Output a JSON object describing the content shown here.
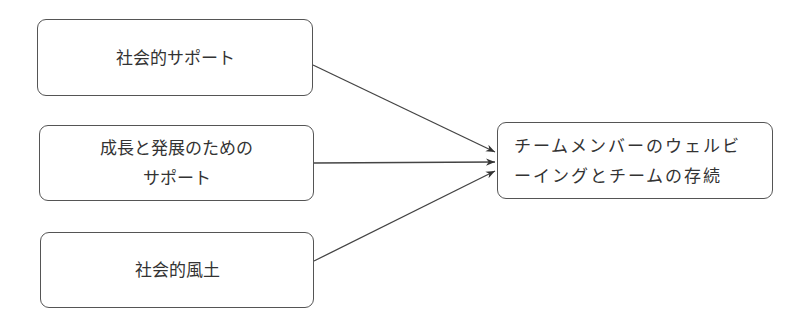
{
  "diagram": {
    "type": "flow",
    "sources": [
      {
        "id": "b1",
        "label": "社会的サポート"
      },
      {
        "id": "b2",
        "label": "成長と発展のための\nサポート"
      },
      {
        "id": "b3",
        "label": "社会的風土"
      }
    ],
    "target": {
      "id": "target",
      "label": "チームメンバーのウェルビ\nーイングとチームの存続"
    },
    "edges": [
      {
        "from": "b1",
        "to": "target"
      },
      {
        "from": "b2",
        "to": "target"
      },
      {
        "from": "b3",
        "to": "target"
      }
    ],
    "colors": {
      "stroke": "#555555",
      "text": "#333333",
      "background": "#ffffff"
    }
  }
}
